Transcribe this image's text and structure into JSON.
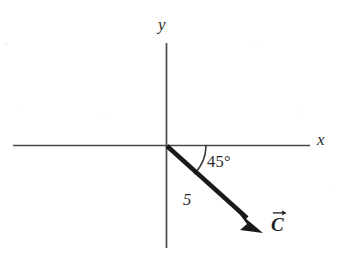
{
  "figure": {
    "background_color": "#ffffff",
    "ink_color": "#3a3a3a",
    "vector_color": "#1a1a1a"
  },
  "axes": {
    "x_label": "x",
    "y_label": "y",
    "x_axis": {
      "x1": 13,
      "y1": 145,
      "x2": 310,
      "y2": 145
    },
    "y_axis": {
      "x1": 166,
      "y1": 43,
      "x2": 166,
      "y2": 248
    },
    "origin": {
      "x": 166,
      "y": 145
    }
  },
  "vector": {
    "label": "C",
    "magnitude_label": "5",
    "angle_label": "45°",
    "angle_degrees": 45,
    "direction": "below positive x-axis",
    "start": {
      "x": 166,
      "y": 145
    },
    "tip": {
      "x": 262,
      "y": 232
    },
    "arrow_style": "solid filled arrowhead",
    "overhead_accent": "right-arrow"
  },
  "angle_arc": {
    "radius": 40,
    "from": "positive x-axis",
    "to": "vector C"
  }
}
